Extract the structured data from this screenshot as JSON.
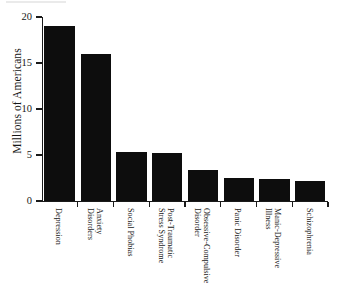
{
  "figure": {
    "kind": "bar-chart",
    "background_color": "#ffffff",
    "bar_color": "#0d0d0d",
    "axis_color": "#1a1a1a"
  },
  "chart_data": {
    "type": "bar",
    "title": "",
    "subtitle": "",
    "xlabel": "",
    "ylabel": "Millions of Americans",
    "ylim": [
      0,
      20
    ],
    "yticks": [
      0,
      5,
      10,
      15,
      20
    ],
    "ytick_labels": [
      "0",
      "5",
      "10",
      "15",
      "20"
    ],
    "grid": false,
    "legend": false,
    "orientation": "vertical",
    "categories": [
      "Depression",
      "Anxiety Disorders",
      "Social Phobias",
      "Post-Traumatic Stress Syndrome",
      "Obsessive-Compulsive Disorder",
      "Panic Disorder",
      "Manic-Depressive Illness",
      "Schizophrenia"
    ],
    "category_lines": [
      [
        "Depression"
      ],
      [
        "Anxiety",
        "Disorders"
      ],
      [
        "Social Phobias"
      ],
      [
        "Post-Traumatic",
        "Stress Syndrome"
      ],
      [
        "Obsessive-Compulsive",
        "Disorder"
      ],
      [
        "Panic Disorder"
      ],
      [
        "Manic-Depressive",
        "Illness"
      ],
      [
        "Schizophrenia"
      ]
    ],
    "values": [
      19,
      16,
      5.3,
      5.2,
      3.4,
      2.5,
      2.4,
      2.2
    ]
  }
}
